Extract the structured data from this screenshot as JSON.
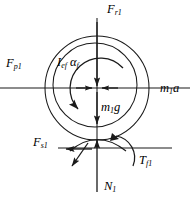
{
  "figure": {
    "type": "free-body-diagram",
    "width": 190,
    "height": 202,
    "stroke_color": "#1a1a1a",
    "text_color": "#000000",
    "background_color": "#ffffff"
  },
  "labels": {
    "top_force": {
      "symbol": "F",
      "subscript": "r1",
      "text": "F r1"
    },
    "left_force": {
      "symbol": "F",
      "subscript": "p1",
      "text": "F p1"
    },
    "right_force": {
      "symbol": "m",
      "subscript": "1",
      "trailing": "a",
      "text": "m 1 a"
    },
    "inertia_moment": {
      "symbol": "I",
      "subscript": "ef",
      "symbol2": "α",
      "subscript2": "f",
      "text": "I ef α f"
    },
    "weight": {
      "symbol": "m",
      "subscript": "1",
      "trailing": "g",
      "text": "m 1 g"
    },
    "side_force": {
      "symbol": "F",
      "subscript": "s1",
      "text": "F s1"
    },
    "friction_torque": {
      "symbol": "T",
      "subscript": "f1",
      "text": "T f1"
    },
    "normal_force": {
      "symbol": "N",
      "subscript": "1",
      "text": "N 1"
    }
  },
  "geometry": {
    "outer_circle": {
      "cx": 97,
      "cy": 88,
      "r": 52
    },
    "inner_circle": {
      "cx": 95,
      "cy": 85,
      "r": 42
    },
    "center_point": {
      "x": 97,
      "y": 88
    },
    "ground_line_y": 148,
    "vertical_axis_x": 97,
    "horizontal_axis_y": 88
  },
  "vectors": [
    {
      "name": "F_r1",
      "direction": "up",
      "position": "top"
    },
    {
      "name": "F_p1",
      "direction": "left",
      "position": "left"
    },
    {
      "name": "m1a",
      "direction": "right",
      "position": "right"
    },
    {
      "name": "m1g",
      "direction": "down",
      "position": "center"
    },
    {
      "name": "N_1",
      "direction": "up",
      "position": "bottom"
    },
    {
      "name": "F_s1",
      "direction": "left",
      "position": "contact"
    },
    {
      "name": "T_f1",
      "direction": "clockwise-arc",
      "position": "contact-right"
    },
    {
      "name": "I_ef_alpha_f",
      "direction": "counterclockwise-arc",
      "position": "center"
    }
  ]
}
